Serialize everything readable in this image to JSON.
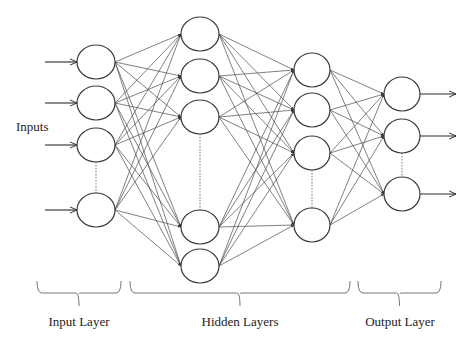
{
  "labels": {
    "inputs": "Inputs",
    "input_layer": "Input Layer",
    "hidden_layers": "Hidden Layers",
    "output_layer": "Output Layer"
  },
  "colors": {
    "stroke": "#3a3a3a",
    "edge": "#4a4a4a",
    "background": "#ffffff"
  },
  "layers": [
    {
      "name": "input",
      "x": 96,
      "rx": 19,
      "ry": 17,
      "nodes": [
        62,
        103,
        145,
        210
      ],
      "ellipsis_between": [
        2,
        3
      ]
    },
    {
      "name": "hidden-1",
      "x": 200,
      "rx": 19,
      "ry": 17,
      "nodes": [
        34,
        76,
        117,
        227,
        266
      ],
      "ellipsis_between": [
        2,
        3
      ]
    },
    {
      "name": "hidden-2",
      "x": 312,
      "rx": 18,
      "ry": 17,
      "nodes": [
        70,
        110,
        153,
        225
      ],
      "ellipsis_between": [
        2,
        3
      ]
    },
    {
      "name": "output",
      "x": 402,
      "rx": 18,
      "ry": 17,
      "nodes": [
        94,
        136,
        194
      ],
      "ellipsis_between": [
        1,
        2
      ]
    }
  ],
  "input_arrows": {
    "x_start": 45,
    "x_end": 77
  },
  "output_arrows": {
    "x_start": 420,
    "x_end": 456
  },
  "braces": [
    {
      "name": "input-layer",
      "x1": 37,
      "x2": 121,
      "y": 293,
      "tip": 306
    },
    {
      "name": "hidden-layers",
      "x1": 130,
      "x2": 350,
      "y": 293,
      "tip": 306
    },
    {
      "name": "output-layer",
      "x1": 358,
      "x2": 441,
      "y": 293,
      "tip": 306
    }
  ],
  "label_positions": {
    "inputs": {
      "x": 16,
      "y": 119
    },
    "input_layer": {
      "x": 79,
      "y": 314
    },
    "hidden_layers": {
      "x": 240,
      "y": 314
    },
    "output_layer": {
      "x": 400,
      "y": 314
    }
  }
}
